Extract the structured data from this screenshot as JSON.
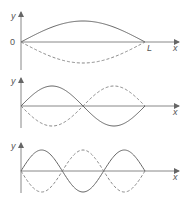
{
  "colors": {
    "axis": "#777777",
    "wave": "#666666"
  },
  "panels": [
    {
      "name": "first-harmonic",
      "harmonic": 1,
      "y_label": "y",
      "x_label": "x",
      "origin_label": "0",
      "end_label": "L",
      "show_origin_label": true,
      "show_end_label": true
    },
    {
      "name": "second-harmonic",
      "harmonic": 2,
      "y_label": "y",
      "x_label": "x",
      "origin_label": "",
      "end_label": "",
      "show_origin_label": false,
      "show_end_label": false
    },
    {
      "name": "third-harmonic",
      "harmonic": 3,
      "y_label": "y",
      "x_label": "x",
      "origin_label": "",
      "end_label": "",
      "show_origin_label": false,
      "show_end_label": false
    }
  ]
}
